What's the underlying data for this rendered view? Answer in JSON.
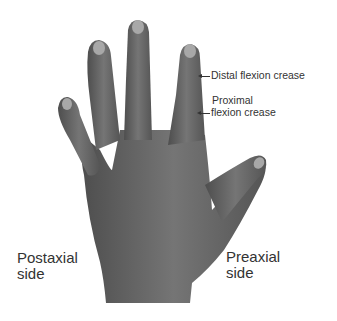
{
  "figure": {
    "skin_color": "#6a6a6a",
    "nail_color": "#a8a8a8"
  },
  "labels": {
    "distal_crease": "Distal flexion crease",
    "proximal_crease_line1": "Proximal",
    "proximal_crease_line2": "flexion crease",
    "postaxial_line1": "Postaxial",
    "postaxial_line2": "side",
    "preaxial_line1": "Preaxial",
    "preaxial_line2": "side"
  }
}
